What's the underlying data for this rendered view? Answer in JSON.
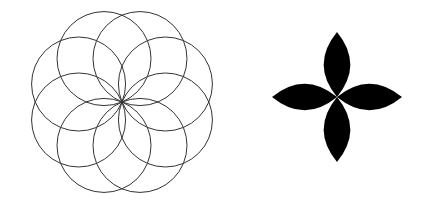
{
  "figure": {
    "width": 425,
    "height": 210,
    "background": "#ffffff",
    "rosette": {
      "shape": "overlapping-circles",
      "circle_count": 8,
      "center": [
        122,
        102
      ],
      "circle_radius": 47,
      "stroke": "#333333"
    },
    "quatrefoil": {
      "shape": "four-petal-flower",
      "petal_count": 4,
      "center": [
        337,
        97
      ],
      "petal_length": 65,
      "fill": "#000000"
    }
  }
}
